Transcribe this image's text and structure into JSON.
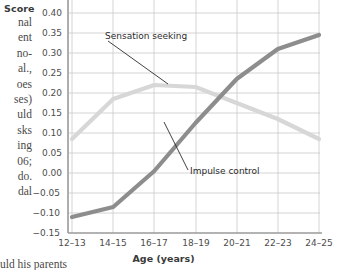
{
  "page_text": {
    "left_column_fragments": [
      "nal",
      "ent",
      "no-",
      "al.,",
      "oes",
      "ses)",
      "uld",
      "sks",
      "ing",
      "06;",
      "do.",
      "dal"
    ],
    "bottom_fragment": "uld his parents"
  },
  "chart_data": {
    "type": "line",
    "title": "",
    "xlabel": "Age (years)",
    "ylabel": "Score",
    "categories": [
      "12–13",
      "14–15",
      "16–17",
      "18–19",
      "20–21",
      "22–23",
      "24–25"
    ],
    "ylim": [
      -0.15,
      0.4
    ],
    "ytick_labels": [
      "0.40",
      "0.35",
      "0.30",
      "0.25",
      "0.20",
      "0.15",
      "0.10",
      "0.05",
      "0.00",
      "−0.05",
      "−0.10",
      "−0.15"
    ],
    "ytick_values": [
      0.4,
      0.35,
      0.3,
      0.25,
      0.2,
      0.15,
      0.1,
      0.05,
      0.0,
      -0.05,
      -0.1,
      -0.15
    ],
    "grid": true,
    "legend_position": "annotations",
    "series": [
      {
        "name": "Sensation seeking",
        "color": "#d7d7d7",
        "values": [
          0.085,
          0.185,
          0.22,
          0.215,
          0.175,
          0.135,
          0.085
        ]
      },
      {
        "name": "Impulse control",
        "color": "#8d8d8d",
        "values": [
          -0.11,
          -0.085,
          0.005,
          0.125,
          0.235,
          0.31,
          0.345
        ]
      }
    ],
    "annotations": [
      {
        "text": "Sensation seeking",
        "target_series": "Sensation seeking"
      },
      {
        "text": "Impulse control",
        "target_series": "Impulse control"
      }
    ]
  }
}
